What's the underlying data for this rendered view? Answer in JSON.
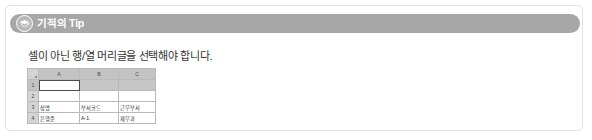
{
  "tip": {
    "icon": "graduation-cap-icon",
    "title": "기적의 Tip",
    "body": "셀이 아닌 행/열 머리글을 선택해야 합니다.",
    "header_color": "#a7a7a7",
    "border_color": "#e3e3e3"
  },
  "spreadsheet": {
    "corner_label": "",
    "column_headers": [
      "A",
      "B",
      "C"
    ],
    "row_headers": [
      "1",
      "2",
      "3",
      "4"
    ],
    "rows": [
      {
        "header": "1",
        "cells": [
          "",
          "",
          ""
        ]
      },
      {
        "header": "2",
        "cells": [
          "",
          "",
          ""
        ]
      },
      {
        "header": "3",
        "cells": [
          "성명",
          "부서코드",
          "근무부서"
        ]
      },
      {
        "header": "4",
        "cells": [
          "은행준",
          "A-1",
          "재무과"
        ]
      }
    ],
    "selection": {
      "active_cell": "A1",
      "selected_range": "A1:C1",
      "selected_column_headers": [
        "A",
        "B",
        "C"
      ]
    },
    "header_fill": "#d4d4d4",
    "selected_fill": "#c6c6c6",
    "grid_color": "#b9b9b9"
  }
}
